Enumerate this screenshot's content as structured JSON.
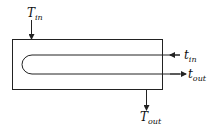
{
  "diagram": {
    "type": "hairpin heat exchanger schematic",
    "labels": {
      "T_in": {
        "main": "T",
        "sub": "in"
      },
      "t_in": {
        "main": "t",
        "sub": "in"
      },
      "t_out": {
        "main": "t",
        "sub": "out"
      },
      "T_out": {
        "main": "T",
        "sub": "out"
      }
    },
    "colors": {
      "stroke": "#222222",
      "background": "#ffffff"
    }
  }
}
